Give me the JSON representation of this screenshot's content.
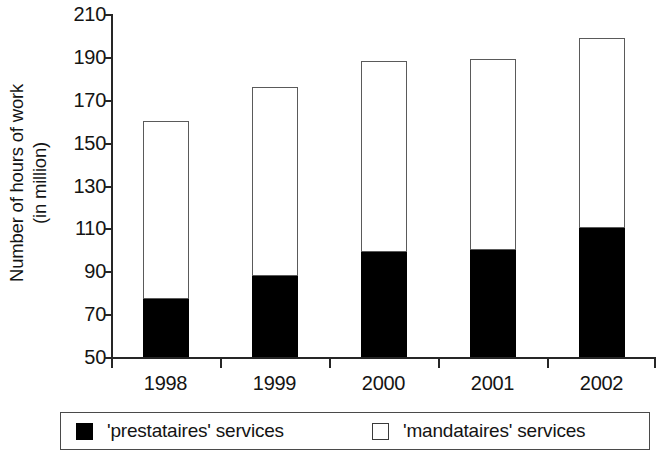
{
  "chart_data": {
    "type": "bar",
    "stacked": true,
    "title": "",
    "subtitle": "",
    "xlabel": "",
    "ylabel": "Number of hours of work (in million)",
    "ylabel_lines": [
      "Number of hours of work",
      "(in million)"
    ],
    "categories": [
      "1998",
      "1999",
      "2000",
      "2001",
      "2002"
    ],
    "series": [
      {
        "name": "'prestataires' services",
        "color": "#000000",
        "values": [
          77,
          88,
          99,
          100,
          110
        ]
      },
      {
        "name": "'mandataires' services",
        "color": "#ffffff",
        "values": [
          83,
          88,
          89,
          89,
          89
        ]
      }
    ],
    "totals": [
      160,
      176,
      188,
      189,
      199
    ],
    "ylim": [
      50,
      210
    ],
    "yticks": [
      210,
      190,
      170,
      150,
      130,
      110,
      90,
      70,
      50
    ],
    "ytick_labels": [
      "210",
      "190",
      "170",
      "150",
      "130",
      "110",
      "90",
      "70",
      "50"
    ],
    "xticks": [
      "1998",
      "1999",
      "2000",
      "2001",
      "2002"
    ],
    "grid": false,
    "legend_position": "bottom",
    "legend_entries": [
      {
        "label": "'prestataires' services",
        "swatch": "filled"
      },
      {
        "label": "'mandataires' services",
        "swatch": "hollow"
      }
    ],
    "annotations": []
  },
  "axis": {
    "y_title_line1": "Number of hours of work",
    "y_title_line2": "(in million)"
  },
  "legend": {
    "items": [
      {
        "label": "'prestataires' services"
      },
      {
        "label": "'mandataires' services"
      }
    ]
  }
}
